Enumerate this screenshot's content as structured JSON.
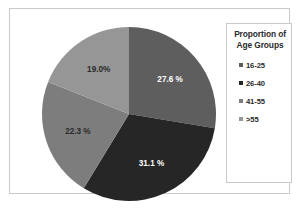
{
  "chart_data": {
    "type": "pie",
    "title": "",
    "legend_title_line1": "Proportion of",
    "legend_title_line2": "Age Groups",
    "legend_position": "right",
    "start_angle_deg": 0,
    "direction": "clockwise",
    "categories": [
      "16-25",
      "26-40",
      "41-55",
      ">55"
    ],
    "values": [
      27.6,
      31.1,
      22.3,
      19.0
    ],
    "labels": [
      "27.6 %",
      "31.1 %",
      "22.3 %",
      "19.0%"
    ],
    "label_colors": [
      "light",
      "light",
      "dark",
      "dark"
    ],
    "colors": [
      "#5e5e5e",
      "#262626",
      "#7d7d7d",
      "#969696"
    ]
  },
  "frame": {
    "border_color": "#c9c9c9",
    "background": "#ffffff"
  }
}
